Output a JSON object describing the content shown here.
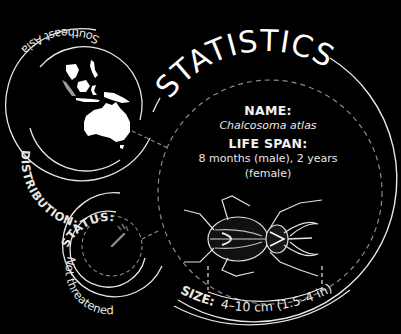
{
  "title": "STATISTICS",
  "distribution": {
    "label": "DISTRIBUTION:",
    "value": "Southeast Asia",
    "map_icon": "southeast-asia-australia-map"
  },
  "name": {
    "label": "NAME:",
    "value": "Chalcosoma atlas"
  },
  "life_span": {
    "label": "LIFE SPAN:",
    "value_line1": "8 months (male), 2 years",
    "value_line2": "(female)"
  },
  "status": {
    "label": "STATUS:",
    "value": "Not threatened",
    "gauge_icon": "threat-level-gauge"
  },
  "size": {
    "label": "SIZE:",
    "value": "4–10 cm (1.5–4 in)"
  },
  "illustration": "atlas-beetle",
  "colors": {
    "background": "#000000",
    "line": "#e6e6e6",
    "dashed": "#8a8a8a"
  }
}
